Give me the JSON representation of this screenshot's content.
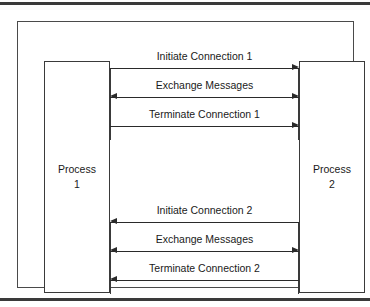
{
  "figure": {
    "line_color": "#2a2a2a",
    "rule_color": "#3a3a3a",
    "background": "#ffffff"
  },
  "actors": {
    "left": {
      "name": "Process",
      "number": "1"
    },
    "right": {
      "name": "Process",
      "number": "2"
    }
  },
  "chart_data": {
    "type": "diagram",
    "participants": [
      "Process 1",
      "Process 2"
    ],
    "messages": [
      {
        "label": "Initiate Connection 1",
        "direction": "right",
        "group": 1
      },
      {
        "label": "Exchange Messages",
        "direction": "both",
        "group": 1
      },
      {
        "label": "Terminate Connection 1",
        "direction": "right",
        "group": 1
      },
      {
        "label": "Initiate Connection 2",
        "direction": "left",
        "group": 2
      },
      {
        "label": "Exchange Messages",
        "direction": "both",
        "group": 2
      },
      {
        "label": "Terminate Connection 2",
        "direction": "left",
        "group": 2
      }
    ]
  },
  "messages": [
    {
      "label": "Initiate Connection 1",
      "direction": "right",
      "top": 28
    },
    {
      "label": "Exchange Messages",
      "direction": "both",
      "top": 57
    },
    {
      "label": "Terminate Connection 1",
      "direction": "right",
      "top": 86
    },
    {
      "label": "Initiate Connection 2",
      "direction": "left",
      "top": 182
    },
    {
      "label": "Exchange Messages",
      "direction": "both",
      "top": 211
    },
    {
      "label": "Terminate Connection 2",
      "direction": "left",
      "top": 240
    }
  ],
  "stems": [
    {
      "side": "left",
      "top": 46,
      "height": 72
    },
    {
      "side": "right",
      "top": 46,
      "height": 72
    },
    {
      "side": "left",
      "top": 200,
      "height": 72
    },
    {
      "side": "right",
      "top": 200,
      "height": 72
    }
  ]
}
